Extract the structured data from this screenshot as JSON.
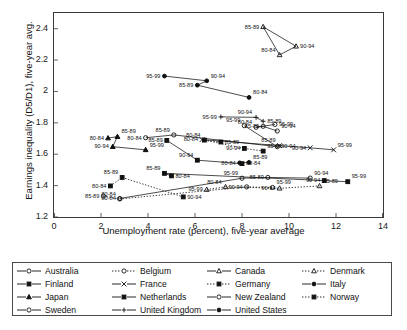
{
  "chart_data": {
    "type": "scatter",
    "title": "",
    "xlabel": "Unemployment rate (percent), five-year average",
    "ylabel": "Earnings inequality (D5/D1), five-year avg.",
    "xlim": [
      0,
      14
    ],
    "ylim": [
      1.2,
      2.5
    ],
    "xticks": [
      0,
      2,
      4,
      6,
      8,
      10,
      12,
      14
    ],
    "yticks": [
      1.2,
      1.4,
      1.6,
      1.8,
      2.0,
      2.2,
      2.4
    ],
    "ytick_labels": [
      "1.2",
      "1.4",
      "1.6",
      "1.8",
      "2",
      "2.2",
      "2.4"
    ],
    "xtick_labels": [
      "0",
      "2",
      "4",
      "6",
      "8",
      "10",
      "12",
      "14"
    ],
    "grid": false,
    "legend_position": "below",
    "point_label_format": "period",
    "series": [
      {
        "name": "Australia",
        "marker": "open-circle",
        "line": "solid",
        "points": [
          {
            "label": "80-84",
            "x": 3.9,
            "y": 1.705
          },
          {
            "label": "85-89",
            "x": 5.1,
            "y": 1.723
          },
          {
            "label": "90-94",
            "x": 9.5,
            "y": 1.648
          },
          {
            "label": "95-99",
            "x": 8.1,
            "y": 1.782
          }
        ]
      },
      {
        "name": "Belgium",
        "marker": "open-circle",
        "line": "dotted",
        "points": [
          {
            "label": "85-89",
            "x": 2.1,
            "y": 1.333
          },
          {
            "label": "80-84",
            "x": 2.8,
            "y": 1.315
          },
          {
            "label": "90-94",
            "x": 8.2,
            "y": 1.392
          },
          {
            "label": "95-99",
            "x": 9.3,
            "y": 1.388
          }
        ]
      },
      {
        "name": "Canada",
        "marker": "open-triangle",
        "line": "solid",
        "points": [
          {
            "label": "85-89",
            "x": 8.9,
            "y": 2.412
          },
          {
            "label": "80-84",
            "x": 9.6,
            "y": 2.233
          },
          {
            "label": "90-94",
            "x": 10.3,
            "y": 2.288
          }
        ]
      },
      {
        "name": "Denmark",
        "marker": "open-triangle",
        "line": "dotted",
        "points": [
          {
            "label": "95-99",
            "x": 6.5,
            "y": 1.375
          },
          {
            "label": "80-84",
            "x": 7.3,
            "y": 1.392
          },
          {
            "label": "90-94",
            "x": 9.6,
            "y": 1.383
          },
          {
            "label": "85-89",
            "x": 11.3,
            "y": 1.398
          }
        ]
      },
      {
        "name": "Finland",
        "marker": "filled-square",
        "line": "solid",
        "points": [
          {
            "label": "80-84",
            "x": 5.0,
            "y": 1.462
          },
          {
            "label": "85-89",
            "x": 4.7,
            "y": 1.478
          },
          {
            "label": "90-94",
            "x": 11.5,
            "y": 1.432
          },
          {
            "label": "95-99",
            "x": 12.5,
            "y": 1.425
          }
        ]
      },
      {
        "name": "France",
        "marker": "cross-x",
        "line": "solid",
        "points": [
          {
            "label": "80-84",
            "x": 6.3,
            "y": 1.693
          },
          {
            "label": "85-89",
            "x": 9.6,
            "y": 1.655
          },
          {
            "label": "90-94",
            "x": 10.9,
            "y": 1.641
          },
          {
            "label": "95-99",
            "x": 11.9,
            "y": 1.628
          }
        ]
      },
      {
        "name": "Germany",
        "marker": "filled-square",
        "line": "dotted",
        "points": [
          {
            "label": "85-89",
            "x": 7.1,
            "y": 1.678
          },
          {
            "label": "80-84",
            "x": 6.4,
            "y": 1.69
          },
          {
            "label": "90-94",
            "x": 8.1,
            "y": 1.637
          },
          {
            "label": "95-99",
            "x": 8.9,
            "y": 1.62
          }
        ]
      },
      {
        "name": "Italy",
        "marker": "filled-circle",
        "line": "solid",
        "points": [
          {
            "label": "80-84",
            "x": 7.9,
            "y": 1.545
          },
          {
            "label": "85-89",
            "x": 8.3,
            "y": 1.548
          }
        ]
      },
      {
        "name": "Japan",
        "marker": "filled-triangle",
        "line": "solid",
        "points": [
          {
            "label": "80-84",
            "x": 2.3,
            "y": 1.703
          },
          {
            "label": "85-89",
            "x": 2.7,
            "y": 1.712
          },
          {
            "label": "90-94",
            "x": 2.5,
            "y": 1.648
          },
          {
            "label": "95-99",
            "x": 3.9,
            "y": 1.628
          }
        ]
      },
      {
        "name": "Netherlands",
        "marker": "filled-square",
        "line": "solid",
        "points": [
          {
            "label": "85-89",
            "x": 4.8,
            "y": 1.688
          },
          {
            "label": "90-94",
            "x": 6.1,
            "y": 1.562
          },
          {
            "label": "80-84",
            "x": 8.0,
            "y": 1.54
          }
        ]
      },
      {
        "name": "New Zealand",
        "marker": "open-circle",
        "line": "solid",
        "points": [
          {
            "label": "80-84",
            "x": 2.8,
            "y": 1.318
          },
          {
            "label": "95-99",
            "x": 8.0,
            "y": 1.447
          },
          {
            "label": "85-89",
            "x": 9.1,
            "y": 1.452
          },
          {
            "label": "90-94",
            "x": 10.9,
            "y": 1.448
          }
        ]
      },
      {
        "name": "Norway",
        "marker": "filled-square",
        "line": "dotted",
        "points": [
          {
            "label": "80-84",
            "x": 2.4,
            "y": 1.398
          },
          {
            "label": "85-89",
            "x": 2.9,
            "y": 1.452
          },
          {
            "label": "90-94",
            "x": 5.5,
            "y": 1.328
          }
        ]
      },
      {
        "name": "Sweden",
        "marker": "open-circle",
        "line": "solid",
        "points": [
          {
            "label": "95-99",
            "x": 9.4,
            "y": 1.79
          },
          {
            "label": "80-84",
            "x": 8.6,
            "y": 1.772
          },
          {
            "label": "85-89",
            "x": 8.9,
            "y": 1.778
          },
          {
            "label": "90-94",
            "x": 9.5,
            "y": 1.748
          }
        ]
      },
      {
        "name": "United Kingdom",
        "marker": "small-plus",
        "line": "solid",
        "points": [
          {
            "label": "95-99",
            "x": 7.1,
            "y": 1.838
          },
          {
            "label": "90-94",
            "x": 8.6,
            "y": 1.835
          },
          {
            "label": "85-89",
            "x": 8.9,
            "y": 1.81
          }
        ]
      },
      {
        "name": "United States",
        "marker": "filled-circle",
        "line": "solid",
        "points": [
          {
            "label": "95-99",
            "x": 4.7,
            "y": 2.098
          },
          {
            "label": "90-94",
            "x": 6.5,
            "y": 2.068
          },
          {
            "label": "85-89",
            "x": 6.1,
            "y": 2.04
          },
          {
            "label": "80-84",
            "x": 8.3,
            "y": 1.962
          }
        ]
      }
    ]
  },
  "legend": {
    "items": [
      {
        "name": "Australia",
        "marker": "open-circle",
        "line": "solid"
      },
      {
        "name": "Belgium",
        "marker": "open-circle",
        "line": "dotted"
      },
      {
        "name": "Canada",
        "marker": "open-triangle",
        "line": "solid"
      },
      {
        "name": "Denmark",
        "marker": "open-triangle",
        "line": "dotted"
      },
      {
        "name": "Finland",
        "marker": "filled-square",
        "line": "solid"
      },
      {
        "name": "France",
        "marker": "cross-x",
        "line": "solid"
      },
      {
        "name": "Germany",
        "marker": "filled-square",
        "line": "dotted"
      },
      {
        "name": "Italy",
        "marker": "filled-circle",
        "line": "solid"
      },
      {
        "name": "Japan",
        "marker": "filled-triangle",
        "line": "solid"
      },
      {
        "name": "Netherlands",
        "marker": "filled-square",
        "line": "solid"
      },
      {
        "name": "New Zealand",
        "marker": "open-circle",
        "line": "solid"
      },
      {
        "name": "Norway",
        "marker": "filled-square",
        "line": "dotted"
      },
      {
        "name": "Sweden",
        "marker": "open-circle",
        "line": "solid"
      },
      {
        "name": "United Kingdom",
        "marker": "small-plus",
        "line": "solid"
      },
      {
        "name": "United States",
        "marker": "filled-circle",
        "line": "solid"
      }
    ]
  },
  "colors": {
    "ink": "#111111",
    "frame": "#3a3a3a",
    "background": "#ffffff"
  }
}
